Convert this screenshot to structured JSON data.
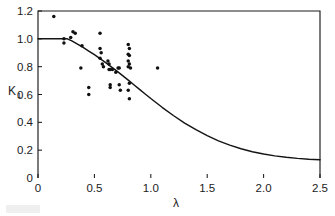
{
  "figure": {
    "background_color": "#ffffff",
    "ink_color": "#141414"
  },
  "axes": {
    "x": {
      "title": "λ",
      "min": 0,
      "max": 2.5,
      "ticks": [
        0,
        0.5,
        1.0,
        1.5,
        2.0,
        2.5
      ],
      "tick_labels": [
        "0",
        "0.5",
        "1.0",
        "1.5",
        "2.0",
        "2.5"
      ]
    },
    "y": {
      "title": "K",
      "title_subscript": "1",
      "min": 0,
      "max": 1.2,
      "ticks": [
        0,
        0.2,
        0.4,
        0.6,
        0.8,
        1.0,
        1.2
      ],
      "tick_labels": [
        "0",
        "0.2",
        "0.4",
        "0.6",
        "0.8",
        "1.0",
        "1.2"
      ]
    }
  },
  "chart_data": {
    "type": "scatter",
    "title": "",
    "xlabel": "λ",
    "ylabel": "K1",
    "xlim": [
      0,
      2.5
    ],
    "ylim": [
      0,
      1.2
    ],
    "grid": false,
    "legend": null,
    "series": [
      {
        "name": "measured data",
        "type": "scatter",
        "marker": "filled-circle",
        "color": "#101010",
        "points": [
          [
            0.14,
            1.16
          ],
          [
            0.23,
            1.0
          ],
          [
            0.23,
            0.97
          ],
          [
            0.29,
            1.01
          ],
          [
            0.31,
            1.05
          ],
          [
            0.33,
            1.04
          ],
          [
            0.39,
            0.95
          ],
          [
            0.38,
            0.79
          ],
          [
            0.45,
            0.65
          ],
          [
            0.45,
            0.6
          ],
          [
            0.55,
            1.04
          ],
          [
            0.55,
            0.93
          ],
          [
            0.56,
            0.9
          ],
          [
            0.55,
            0.86
          ],
          [
            0.57,
            0.82
          ],
          [
            0.58,
            0.8
          ],
          [
            0.62,
            0.84
          ],
          [
            0.63,
            0.82
          ],
          [
            0.63,
            0.78
          ],
          [
            0.64,
            0.78
          ],
          [
            0.66,
            0.78
          ],
          [
            0.64,
            0.67
          ],
          [
            0.64,
            0.65
          ],
          [
            0.69,
            0.76
          ],
          [
            0.71,
            0.79
          ],
          [
            0.72,
            0.79
          ],
          [
            0.72,
            0.67
          ],
          [
            0.73,
            0.63
          ],
          [
            0.8,
            0.96
          ],
          [
            0.81,
            0.93
          ],
          [
            0.8,
            0.89
          ],
          [
            0.81,
            0.88
          ],
          [
            0.8,
            0.84
          ],
          [
            0.81,
            0.82
          ],
          [
            0.8,
            0.8
          ],
          [
            0.82,
            0.79
          ],
          [
            0.81,
            0.68
          ],
          [
            0.8,
            0.63
          ],
          [
            0.81,
            0.57
          ],
          [
            1.06,
            0.79
          ]
        ]
      },
      {
        "name": "theoretical curve",
        "type": "line",
        "color": "#141414",
        "points": [
          [
            0.0,
            1.0
          ],
          [
            0.1,
            1.0
          ],
          [
            0.2,
            1.0
          ],
          [
            0.26,
            1.0
          ],
          [
            0.3,
            0.985
          ],
          [
            0.35,
            0.962
          ],
          [
            0.4,
            0.938
          ],
          [
            0.45,
            0.912
          ],
          [
            0.5,
            0.886
          ],
          [
            0.55,
            0.858
          ],
          [
            0.6,
            0.829
          ],
          [
            0.65,
            0.799
          ],
          [
            0.7,
            0.768
          ],
          [
            0.75,
            0.736
          ],
          [
            0.8,
            0.703
          ],
          [
            0.85,
            0.67
          ],
          [
            0.9,
            0.637
          ],
          [
            0.95,
            0.604
          ],
          [
            1.0,
            0.571
          ],
          [
            1.1,
            0.508
          ],
          [
            1.2,
            0.449
          ],
          [
            1.3,
            0.395
          ],
          [
            1.4,
            0.347
          ],
          [
            1.5,
            0.304
          ],
          [
            1.6,
            0.267
          ],
          [
            1.7,
            0.236
          ],
          [
            1.8,
            0.21
          ],
          [
            1.9,
            0.189
          ],
          [
            2.0,
            0.172
          ],
          [
            2.1,
            0.159
          ],
          [
            2.2,
            0.149
          ],
          [
            2.3,
            0.141
          ],
          [
            2.4,
            0.135
          ],
          [
            2.5,
            0.131
          ]
        ]
      }
    ]
  }
}
